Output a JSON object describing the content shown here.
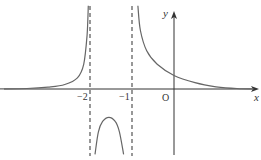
{
  "chart_data": {
    "type": "line",
    "title": "",
    "xlabel": "x",
    "ylabel": "y",
    "origin_label": "O",
    "x_ticks": [
      {
        "value": -2,
        "label": "−2"
      },
      {
        "value": -1,
        "label": "−1"
      }
    ],
    "asymptotes": [
      {
        "type": "vertical",
        "x": -2,
        "style": "dashed"
      },
      {
        "type": "vertical",
        "x": -1,
        "style": "dashed"
      }
    ],
    "xlim": [
      -4.2,
      1.95
    ],
    "ylim": [
      -1.6,
      1.85
    ],
    "series": [
      {
        "name": "left-branch",
        "points": [
          [
            -4.2,
            0.0
          ],
          [
            -3.5,
            0.01
          ],
          [
            -3.0,
            0.04
          ],
          [
            -2.6,
            0.1
          ],
          [
            -2.3,
            0.25
          ],
          [
            -2.15,
            0.55
          ],
          [
            -2.07,
            1.2
          ],
          [
            -2.04,
            1.85
          ]
        ]
      },
      {
        "name": "middle-branch",
        "points": [
          [
            -1.88,
            -1.45
          ],
          [
            -1.8,
            -0.95
          ],
          [
            -1.7,
            -0.72
          ],
          [
            -1.55,
            -0.63
          ],
          [
            -1.4,
            -0.72
          ],
          [
            -1.3,
            -0.95
          ],
          [
            -1.2,
            -1.45
          ]
        ]
      },
      {
        "name": "right-branch",
        "points": [
          [
            -0.86,
            1.85
          ],
          [
            -0.8,
            1.3
          ],
          [
            -0.65,
            0.85
          ],
          [
            -0.4,
            0.55
          ],
          [
            0.0,
            0.3
          ],
          [
            0.5,
            0.14
          ],
          [
            1.0,
            0.05
          ],
          [
            1.5,
            0.01
          ],
          [
            1.9,
            0.0
          ]
        ]
      }
    ],
    "colors": {
      "curve": "#666666",
      "axis": "#333333",
      "asymptote": "#444444"
    }
  }
}
